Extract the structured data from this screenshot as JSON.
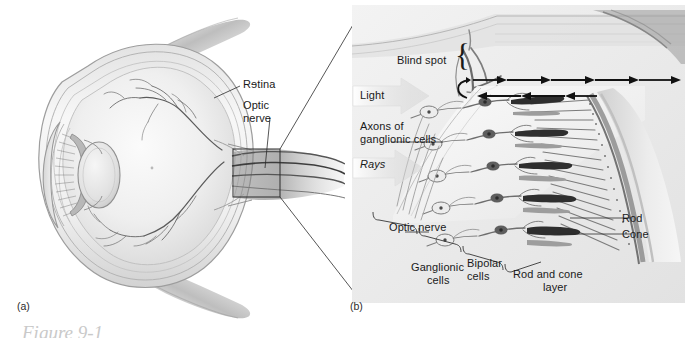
{
  "figure": {
    "caption_partial": "Figure 9-1",
    "panel_a_letter": "(a)",
    "panel_b_letter": "(b)"
  },
  "panel_a": {
    "name": "sagittal-section-of-eyeball",
    "labels": [
      {
        "key": "retina",
        "text": "Rɘtina"
      },
      {
        "key": "optic_nerve_line1",
        "text": "Optic"
      },
      {
        "key": "optic_nerve_line2",
        "text": "nerve"
      }
    ],
    "callout_box": {
      "x": 233,
      "y": 149,
      "width": 47,
      "height": 48
    }
  },
  "panel_b": {
    "name": "magnified-retina-microstructure",
    "labels": [
      {
        "key": "blind_spot",
        "text": "Blind spot"
      },
      {
        "key": "light",
        "text": "Light"
      },
      {
        "key": "axons_line1",
        "text": "Axons of"
      },
      {
        "key": "axons_line2",
        "text": "ganglionic cells"
      },
      {
        "key": "rays",
        "text": "Rays"
      },
      {
        "key": "optic_nerve",
        "text": "Optic nerve"
      },
      {
        "key": "ganglionic_line1",
        "text": "Ganglionic"
      },
      {
        "key": "ganglionic_line2",
        "text": "cells"
      },
      {
        "key": "bipolar_line1",
        "text": "Bipolar"
      },
      {
        "key": "bipolar_line2",
        "text": "cells"
      },
      {
        "key": "rod_cone_line1",
        "text": "Rod and cone"
      },
      {
        "key": "rod_cone_line2",
        "text": "layer"
      },
      {
        "key": "rod",
        "text": "Rod"
      },
      {
        "key": "cone",
        "text": "Cone"
      }
    ],
    "brace_glyph": "{"
  },
  "colors": {
    "page_background": "#ffffff",
    "panel_b_background": "#ededed",
    "label_text": "#1a1a1a",
    "line_stroke": "#3a3a3a",
    "sclera_light": "#f4f4f4",
    "sclera_shade": "#c9c9c9",
    "vitreous": "#ededed",
    "lens": "#dcdcdc",
    "arrow_dark": "#111111",
    "caption_faded": "#c9c9c9"
  }
}
